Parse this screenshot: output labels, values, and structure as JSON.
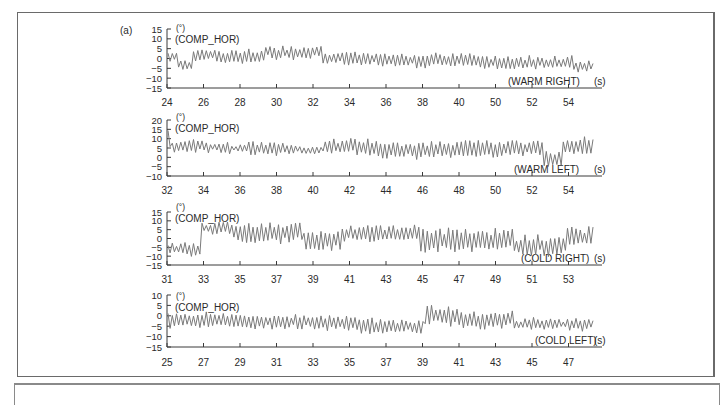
{
  "chart_data": [
    {
      "type": "line",
      "panel_label": "(a)",
      "title": "",
      "ylabel_unit": "(°)",
      "series_name": "(COMP_HOR)",
      "condition_label": "(WARM RIGHT)",
      "xlabel": "(s)",
      "yticks": [
        15,
        10,
        5,
        0,
        -5,
        -10,
        -15
      ],
      "ylim": [
        -15,
        15
      ],
      "xticks": [
        "24",
        "26",
        "28",
        "30",
        "32",
        "34",
        "36",
        "38",
        "40",
        "50",
        "52",
        "54"
      ],
      "grid": false,
      "segments": [
        {
          "x0": 0.0,
          "x1": 0.22,
          "mean": 0.5,
          "amp": 2.5
        },
        {
          "x0": 0.22,
          "x1": 0.62,
          "mean": -3,
          "amp": 2.5
        },
        {
          "x0": 0.62,
          "x1": 1.0,
          "mean": 2,
          "amp": 2.5
        },
        {
          "x0": 1.0,
          "x1": 1.3,
          "mean": 1.5,
          "amp": 3
        },
        {
          "x0": 1.3,
          "x1": 2.5,
          "mean": 1,
          "amp": 3
        },
        {
          "x0": 2.5,
          "x1": 3.2,
          "mean": 3,
          "amp": 3
        },
        {
          "x0": 3.2,
          "x1": 4.0,
          "mean": 3,
          "amp": 3
        },
        {
          "x0": 4.0,
          "x1": 5.5,
          "mean": 0,
          "amp": 3
        },
        {
          "x0": 5.5,
          "x1": 8.0,
          "mean": -1,
          "amp": 3
        },
        {
          "x0": 8.0,
          "x1": 10.5,
          "mean": -2,
          "amp": 3
        },
        {
          "x0": 10.5,
          "x1": 11.0,
          "mean": -4,
          "amp": 2.5
        }
      ]
    },
    {
      "type": "line",
      "ylabel_unit": "(°)",
      "series_name": "(COMP_HOR)",
      "condition_label": "(WARM LEFT)",
      "xlabel": "(s)",
      "yticks": [
        20,
        15,
        10,
        5,
        0,
        -5,
        -10
      ],
      "ylim": [
        -10,
        20
      ],
      "xticks": [
        "32",
        "34",
        "36",
        "38",
        "40",
        "42",
        "44",
        "46",
        "48",
        "50",
        "52",
        "54"
      ],
      "grid": false,
      "segments": [
        {
          "x0": 0.0,
          "x1": 0.1,
          "mean": 10,
          "amp": 5
        },
        {
          "x0": 0.1,
          "x1": 1.0,
          "mean": 6,
          "amp": 3
        },
        {
          "x0": 1.0,
          "x1": 2.0,
          "mean": 5,
          "amp": 2.5
        },
        {
          "x0": 2.0,
          "x1": 3.0,
          "mean": 5,
          "amp": 3
        },
        {
          "x0": 3.0,
          "x1": 4.0,
          "mean": 4,
          "amp": 2
        },
        {
          "x0": 4.0,
          "x1": 5.2,
          "mean": 6,
          "amp": 3.5
        },
        {
          "x0": 5.2,
          "x1": 7.5,
          "mean": 4,
          "amp": 4
        },
        {
          "x0": 7.5,
          "x1": 9.7,
          "mean": 5,
          "amp": 4
        },
        {
          "x0": 9.7,
          "x1": 10.2,
          "mean": -1,
          "amp": 4
        },
        {
          "x0": 10.2,
          "x1": 11.0,
          "mean": 6,
          "amp": 4
        }
      ]
    },
    {
      "type": "line",
      "ylabel_unit": "(°)",
      "series_name": "(COMP_HOR)",
      "condition_label": "(COLD RIGHT)",
      "xlabel": "(s)",
      "yticks": [
        15,
        10,
        5,
        0,
        -5,
        -10,
        -15
      ],
      "ylim": [
        -15,
        15
      ],
      "xticks": [
        "31",
        "33",
        "35",
        "37",
        "39",
        "41",
        "43",
        "45",
        "47",
        "49",
        "51",
        "53"
      ],
      "grid": false,
      "segments": [
        {
          "x0": 0.0,
          "x1": 0.85,
          "mean": -6,
          "amp": 3
        },
        {
          "x0": 0.85,
          "x1": 1.6,
          "mean": 6,
          "amp": 3
        },
        {
          "x0": 1.6,
          "x1": 2.0,
          "mean": 3,
          "amp": 5
        },
        {
          "x0": 2.0,
          "x1": 3.5,
          "mean": 3,
          "amp": 5
        },
        {
          "x0": 3.5,
          "x1": 4.5,
          "mean": -1,
          "amp": 5
        },
        {
          "x0": 4.5,
          "x1": 6.5,
          "mean": 3,
          "amp": 4
        },
        {
          "x0": 6.5,
          "x1": 9.0,
          "mean": -1,
          "amp": 6
        },
        {
          "x0": 9.0,
          "x1": 10.3,
          "mean": -4,
          "amp": 5
        },
        {
          "x0": 10.3,
          "x1": 11.0,
          "mean": 1,
          "amp": 5
        }
      ]
    },
    {
      "type": "line",
      "ylabel_unit": "(°)",
      "series_name": "(COMP_HOR)",
      "condition_label": "(COLD LEFT)",
      "xlabel": "(s)",
      "yticks": [
        10,
        5,
        0,
        -5,
        -10,
        -15
      ],
      "ylim": [
        -15,
        10
      ],
      "xticks": [
        "25",
        "27",
        "29",
        "31",
        "33",
        "35",
        "37",
        "39",
        "41",
        "43",
        "45",
        "47"
      ],
      "grid": false,
      "segments": [
        {
          "x0": 0.0,
          "x1": 2.0,
          "mean": -2,
          "amp": 3
        },
        {
          "x0": 2.0,
          "x1": 5.0,
          "mean": -3,
          "amp": 3
        },
        {
          "x0": 5.0,
          "x1": 6.6,
          "mean": -5,
          "amp": 3
        },
        {
          "x0": 6.6,
          "x1": 7.5,
          "mean": 0,
          "amp": 4
        },
        {
          "x0": 7.5,
          "x1": 9.0,
          "mean": -2,
          "amp": 3.5
        },
        {
          "x0": 9.0,
          "x1": 11.0,
          "mean": -4,
          "amp": 2.5
        }
      ]
    }
  ],
  "style": {
    "line_color": "#7a7a7a",
    "axis_color": "#3a3a3a",
    "text_color": "#2a2a2a",
    "frame_color": "#6a6a6a"
  }
}
